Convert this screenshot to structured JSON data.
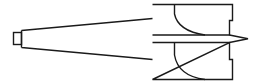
{
  "diagram": {
    "type": "technical-line-drawing",
    "colors": {
      "background": "#ffffff",
      "stroke": "#1a1a1a"
    },
    "parts": [
      {
        "id": "tang",
        "label": ""
      },
      {
        "id": "taper-shank",
        "label": ""
      },
      {
        "id": "cutter-head",
        "label": ""
      },
      {
        "id": "center-point",
        "label": ""
      },
      {
        "id": "upper-flute",
        "label": ""
      },
      {
        "id": "lower-flute",
        "label": ""
      }
    ]
  }
}
